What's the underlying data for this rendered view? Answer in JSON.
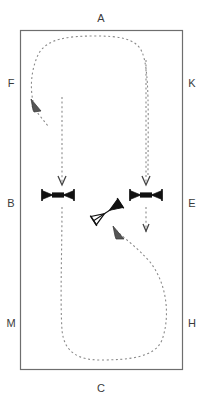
{
  "diagram": {
    "canvas": {
      "width": 203,
      "height": 399,
      "background": "#ffffff"
    },
    "colors": {
      "boundary_stroke": "#6e6e6e",
      "path_stroke": "#8a8a8a",
      "symbol_stroke": "#111111",
      "label_fill": "#3b3b3b"
    },
    "boundary": {
      "name": "enclosure-rectangle",
      "x": 20,
      "y": 30,
      "width": 163,
      "height": 340
    },
    "labels": [
      {
        "id": "A",
        "text": "A",
        "x": 101,
        "y": 22,
        "side": "top"
      },
      {
        "id": "F",
        "text": "F",
        "x": 11,
        "y": 83,
        "side": "left"
      },
      {
        "id": "K",
        "text": "K",
        "x": 192,
        "y": 83,
        "side": "right"
      },
      {
        "id": "B",
        "text": "B",
        "x": 11,
        "y": 203,
        "side": "left"
      },
      {
        "id": "E",
        "text": "E",
        "x": 192,
        "y": 203,
        "side": "right"
      },
      {
        "id": "M",
        "text": "M",
        "x": 11,
        "y": 323,
        "side": "left"
      },
      {
        "id": "H",
        "text": "H",
        "x": 192,
        "y": 323,
        "side": "right"
      },
      {
        "id": "C",
        "text": "C",
        "x": 101,
        "y": 388,
        "side": "bottom"
      }
    ],
    "symbols": [
      {
        "id": "sym-left",
        "name": "bowtie-valve-symbol",
        "x": 58,
        "y": 195,
        "rotation": 0
      },
      {
        "id": "sym-middle",
        "name": "bowtie-valve-symbol",
        "x": 107,
        "y": 212,
        "rotation": -35
      },
      {
        "id": "sym-right",
        "name": "bowtie-valve-symbol",
        "x": 146,
        "y": 195,
        "rotation": 0
      }
    ],
    "flow_paths": [
      {
        "id": "path-left-down",
        "name": "flow-path-left-descending",
        "description": "dashed vertical line descending into left symbol",
        "arrow": "down"
      },
      {
        "id": "path-right-down",
        "name": "flow-path-right-descending",
        "description": "dashed curve from top arching down to right symbol",
        "arrow": "down"
      },
      {
        "id": "path-outer-loop",
        "name": "flow-path-upper-loop",
        "description": "dashed loop from upper right sweeping across top and down to left arrowhead near F",
        "arrow": "up-left"
      },
      {
        "id": "path-lower-loop",
        "name": "flow-path-lower-loop",
        "description": "dashed loop from left descending around bottom and up to middle symbol",
        "arrow": "up-left"
      },
      {
        "id": "path-middle-down",
        "name": "flow-path-middle-descending",
        "description": "short dashed stub descending below right symbol",
        "arrow": "down"
      }
    ]
  }
}
